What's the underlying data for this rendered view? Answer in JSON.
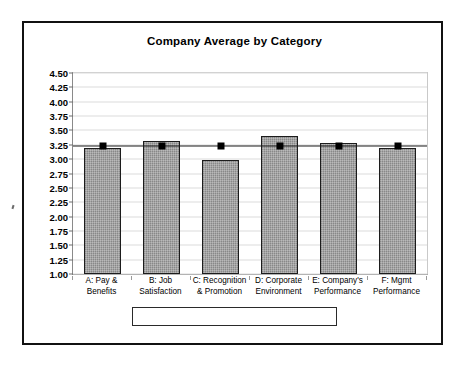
{
  "chart_data": {
    "type": "bar",
    "title": "Company Average by Category",
    "xlabel": "",
    "ylabel": "",
    "ylim": [
      1.0,
      4.5
    ],
    "ytick_step": 0.25,
    "ytick_labels": [
      "4.50",
      "4.25",
      "4.00",
      "3.75",
      "3.50",
      "3.25",
      "3.00",
      "2.75",
      "2.50",
      "2.25",
      "2.00",
      "1.75",
      "1.50",
      "1.25",
      "1.00"
    ],
    "grid": true,
    "legend_position": "bottom",
    "categories": [
      "A: Pay &\nBenefits",
      "B: Job\nSatisfaction",
      "C: Recognition\n& Promotion",
      "D: Corporate\nEnvironment",
      "E: Company's\nPerformance",
      "F: Mgmt\nPerformance"
    ],
    "series": [
      {
        "name": "Category Average",
        "type": "bar",
        "values": [
          3.2,
          3.32,
          2.98,
          3.4,
          3.29,
          3.19
        ]
      },
      {
        "name": "Overall Average",
        "type": "line",
        "values": [
          3.23,
          3.23,
          3.23,
          3.23,
          3.23,
          3.23
        ]
      }
    ],
    "colors": {
      "bar_fill": "#9b9b9b",
      "bar_border": "#1c1c1c",
      "line": "#1a1a1a",
      "marker": "#000000",
      "frame": "#111111",
      "gridline": "#dcdcdc"
    }
  },
  "legend": {
    "items": [
      {
        "label": "Category Average",
        "marker": "bar-swatch"
      },
      {
        "label": "Overall Average",
        "marker": "line-square-marker"
      }
    ]
  }
}
